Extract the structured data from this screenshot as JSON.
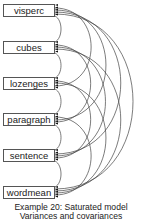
{
  "diagram": {
    "variables": [
      {
        "label": "visperc",
        "top": 4
      },
      {
        "label": "cubes",
        "top": 41
      },
      {
        "label": "lozenges",
        "top": 77
      },
      {
        "label": "paragraph",
        "top": 113
      },
      {
        "label": "sentence",
        "top": 149
      },
      {
        "label": "wordmean",
        "top": 186
      }
    ],
    "caption_line1": "Example 20: Saturated model",
    "caption_line2": "Variances and covariances"
  }
}
